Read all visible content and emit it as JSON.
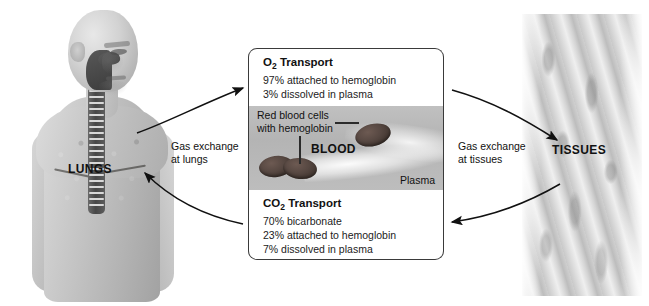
{
  "diagram": {
    "lungs_label": "LUNGS",
    "tissues_label": "TISSUES",
    "gas_exchange_lungs": "Gas exchange\nat lungs",
    "gas_exchange_lungs_line1": "Gas exchange",
    "gas_exchange_lungs_line2": "at lungs",
    "gas_exchange_tissues_line1": "Gas exchange",
    "gas_exchange_tissues_line2": "at tissues"
  },
  "o2_box": {
    "title_prefix": "O",
    "title_sub": "2",
    "title_suffix": " Transport",
    "lines": [
      "97% attached to hemoglobin",
      "3% dissolved in plasma"
    ]
  },
  "co2_box": {
    "title_prefix": "CO",
    "title_sub": "2",
    "title_suffix": " Transport",
    "lines": [
      "70% bicarbonate",
      "23% attached to hemoglobin",
      "7% dissolved in plasma"
    ]
  },
  "blood_panel": {
    "rbc_label_line1": "Red blood cells",
    "rbc_label_line2": "with hemoglobin",
    "blood_word": "BLOOD",
    "plasma_word": "Plasma"
  },
  "colors": {
    "border": "#3a3a3a",
    "plasma_background": "#b8b8b8",
    "red_blood_cell": "#574842",
    "lung_tissue": "#6f6a62",
    "text": "#111111"
  }
}
